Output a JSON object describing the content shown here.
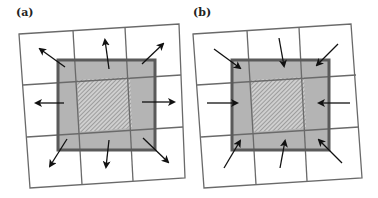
{
  "panels": [
    {
      "label": "(a)",
      "arrow_direction": "outward",
      "offset_x": 0
    },
    {
      "label": "(b)",
      "arrow_direction": "inward",
      "offset_x": 174
    }
  ],
  "colors": {
    "grid_line": "#6a6a6a",
    "square_fill": "#b4b4b4",
    "square_border": "#5a5a5a",
    "hatch_fill": "#cfcfcf",
    "hatch_line": "#7a7a7a",
    "arrow": "#111111",
    "background": "#ffffff"
  }
}
